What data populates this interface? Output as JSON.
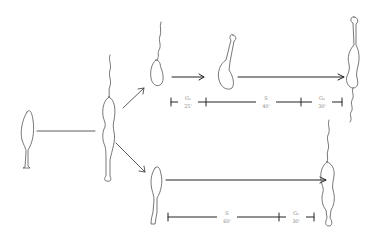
{
  "diagram": {
    "type": "cell-cycle-schematic",
    "colors": {
      "line": "#222222",
      "outline": "#555555",
      "label": "#8a8a8a",
      "background": "#ffffff"
    },
    "top_timeline": {
      "phases": [
        {
          "name": "G₁",
          "duration": "25'"
        },
        {
          "name": "S",
          "duration": "40'"
        },
        {
          "name": "G₂",
          "duration": "30'"
        }
      ]
    },
    "bottom_timeline": {
      "phases": [
        {
          "name": "S",
          "duration": "60'"
        },
        {
          "name": "G₂",
          "duration": "30'"
        }
      ]
    }
  }
}
